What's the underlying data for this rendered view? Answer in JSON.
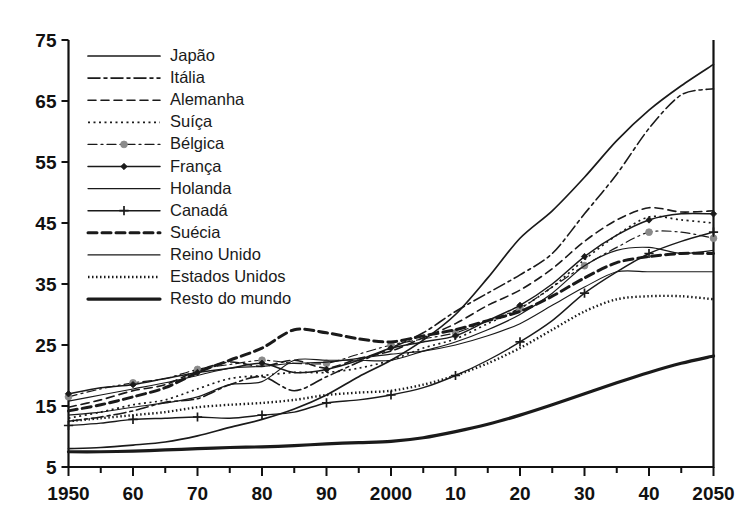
{
  "chart_data": {
    "type": "line",
    "title": "",
    "subtitle": "",
    "xlabel": "",
    "ylabel": "",
    "xlim": [
      1950,
      2050
    ],
    "ylim": [
      5,
      75
    ],
    "yticks": [
      5,
      15,
      25,
      35,
      45,
      55,
      65,
      75
    ],
    "ytick_labels": [
      "5",
      "15",
      "25",
      "35",
      "45",
      "55",
      "65",
      "75"
    ],
    "xticks": [
      1950,
      1960,
      1970,
      1980,
      1990,
      2000,
      2010,
      2020,
      2030,
      2040,
      2050
    ],
    "xtick_labels": [
      "1950",
      "60",
      "70",
      "80",
      "90",
      "2000",
      "10",
      "20",
      "30",
      "40",
      "2050"
    ],
    "xminor_ticks": [
      1955,
      1965,
      1975,
      1985,
      1995,
      2005,
      2015,
      2025,
      2035,
      2045
    ],
    "grid": false,
    "legend_position": "upper-left-inside",
    "x": [
      1950,
      1955,
      1960,
      1965,
      1970,
      1975,
      1980,
      1985,
      1990,
      1995,
      2000,
      2005,
      2010,
      2015,
      2020,
      2025,
      2030,
      2035,
      2040,
      2045,
      2050
    ],
    "series": [
      {
        "name": "Japão",
        "style": "solid",
        "width": 1.7,
        "marker": "none",
        "color": "#1a1a1a",
        "values": [
          8.0,
          8.2,
          8.6,
          9.1,
          10.1,
          11.5,
          12.8,
          14.5,
          16.8,
          19.8,
          22.5,
          25.8,
          30.0,
          36.0,
          42.5,
          47.0,
          52.5,
          58.5,
          63.5,
          67.5,
          71.0
        ]
      },
      {
        "name": "Itália",
        "style": "dashdot",
        "width": 1.6,
        "marker": "none",
        "color": "#1a1a1a",
        "values": [
          12.5,
          13.2,
          14.2,
          15.6,
          16.2,
          18.5,
          19.8,
          17.5,
          19.8,
          22.2,
          24.5,
          27.0,
          30.5,
          33.5,
          36.5,
          40.0,
          46.5,
          53.0,
          60.5,
          66.0,
          67.0
        ]
      },
      {
        "name": "Alemanha",
        "style": "dashed",
        "width": 1.6,
        "marker": "none",
        "color": "#1a1a1a",
        "values": [
          14.8,
          16.0,
          17.5,
          18.5,
          20.8,
          22.2,
          21.5,
          22.5,
          21.2,
          22.8,
          24.0,
          26.2,
          28.5,
          31.5,
          34.0,
          37.5,
          42.0,
          45.5,
          47.5,
          46.8,
          47.0
        ]
      },
      {
        "name": "Suíça",
        "style": "dotted",
        "width": 1.7,
        "marker": "none",
        "color": "#1a1a1a",
        "values": [
          13.0,
          14.0,
          15.2,
          16.0,
          17.8,
          19.5,
          20.0,
          20.5,
          20.5,
          21.2,
          22.5,
          24.5,
          26.0,
          28.5,
          31.0,
          34.5,
          39.0,
          43.0,
          46.0,
          45.5,
          45.0
        ]
      },
      {
        "name": "Bélgica",
        "style": "dashdot-marker",
        "width": 1.2,
        "marker": "circle",
        "color": "#8a8a8a",
        "values": [
          16.5,
          17.8,
          18.8,
          19.5,
          21.0,
          21.8,
          22.5,
          22.0,
          22.0,
          23.5,
          25.0,
          26.0,
          27.0,
          29.0,
          31.0,
          34.5,
          38.0,
          41.0,
          43.5,
          43.5,
          42.5
        ]
      },
      {
        "name": "França",
        "style": "solid-marker",
        "width": 1.5,
        "marker": "diamond",
        "color": "#1a1a1a",
        "values": [
          17.0,
          18.0,
          18.5,
          19.5,
          20.5,
          21.2,
          22.0,
          20.5,
          21.0,
          22.5,
          24.5,
          25.5,
          26.5,
          29.0,
          31.5,
          35.0,
          39.5,
          43.0,
          45.5,
          46.5,
          46.5
        ]
      },
      {
        "name": "Holanda",
        "style": "solid-thin",
        "width": 1.2,
        "marker": "none",
        "color": "#6e6e6e",
        "values": [
          13.5,
          14.0,
          14.8,
          15.5,
          16.5,
          18.5,
          19.0,
          22.5,
          22.5,
          22.5,
          22.5,
          24.0,
          25.5,
          27.5,
          30.0,
          33.5,
          38.0,
          40.5,
          41.0,
          40.0,
          40.5
        ]
      },
      {
        "name": "Canadá",
        "style": "solid-plus",
        "width": 1.4,
        "marker": "plus",
        "color": "#1a1a1a",
        "values": [
          11.8,
          12.2,
          12.8,
          13.0,
          13.2,
          13.0,
          13.5,
          14.0,
          15.5,
          16.0,
          16.8,
          18.0,
          20.0,
          22.5,
          25.5,
          29.0,
          33.5,
          37.0,
          40.0,
          42.0,
          43.5
        ]
      },
      {
        "name": "Suécia",
        "style": "thick-dashed",
        "width": 3.0,
        "marker": "none",
        "color": "#111111",
        "values": [
          14.2,
          15.2,
          16.5,
          18.0,
          20.5,
          22.5,
          24.5,
          27.5,
          27.0,
          26.0,
          25.5,
          26.5,
          27.5,
          29.0,
          30.5,
          33.0,
          36.0,
          38.5,
          39.5,
          40.0,
          40.0
        ]
      },
      {
        "name": "Reino Unido",
        "style": "solid-thin2",
        "width": 1.1,
        "marker": "none",
        "color": "#4a4a4a",
        "values": [
          15.8,
          16.8,
          17.8,
          18.8,
          20.0,
          21.2,
          21.5,
          22.0,
          22.2,
          22.8,
          23.5,
          24.0,
          25.0,
          26.5,
          28.5,
          31.5,
          34.5,
          37.0,
          37.0,
          37.0,
          37.0
        ]
      },
      {
        "name": "Estados Unidos",
        "style": "fine-dotted",
        "width": 2.4,
        "marker": "none",
        "color": "#1a1a1a",
        "values": [
          12.5,
          13.0,
          13.5,
          14.0,
          14.8,
          15.2,
          15.5,
          16.0,
          16.8,
          17.2,
          17.5,
          18.5,
          20.0,
          22.0,
          24.5,
          27.5,
          30.5,
          32.5,
          33.0,
          33.0,
          32.5
        ]
      },
      {
        "name": "Resto do mundo",
        "style": "thick-solid",
        "width": 3.2,
        "marker": "none",
        "color": "#111111",
        "values": [
          7.5,
          7.5,
          7.6,
          7.8,
          8.0,
          8.2,
          8.3,
          8.5,
          8.8,
          9.0,
          9.2,
          9.8,
          10.8,
          12.0,
          13.5,
          15.2,
          17.0,
          18.8,
          20.5,
          22.0,
          23.2
        ]
      }
    ]
  },
  "legend": {
    "entries": [
      {
        "label": "Japão"
      },
      {
        "label": "Itália"
      },
      {
        "label": "Alemanha"
      },
      {
        "label": "Suíça"
      },
      {
        "label": "Bélgica"
      },
      {
        "label": "França"
      },
      {
        "label": "Holanda"
      },
      {
        "label": "Canadá"
      },
      {
        "label": "Suécia"
      },
      {
        "label": "Reino Unido"
      },
      {
        "label": "Estados Unidos"
      },
      {
        "label": "Resto do mundo"
      }
    ]
  }
}
